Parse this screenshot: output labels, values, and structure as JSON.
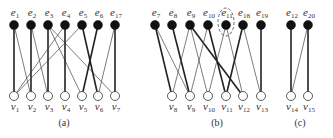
{
  "graphs": [
    {
      "id": "a",
      "caption": "(a)",
      "caption_pos": [
        64,
        126
      ],
      "top_y": 25,
      "bottom_y": 96,
      "top_nodes": [
        {
          "id": "e1",
          "base": "e",
          "sub": "1",
          "x": 14
        },
        {
          "id": "e2",
          "base": "e",
          "sub": "2",
          "x": 31
        },
        {
          "id": "e3",
          "base": "e",
          "sub": "3",
          "x": 48
        },
        {
          "id": "e4",
          "base": "e",
          "sub": "4",
          "x": 65
        },
        {
          "id": "e5",
          "base": "e",
          "sub": "5",
          "x": 82
        },
        {
          "id": "e6",
          "base": "e",
          "sub": "6",
          "x": 98
        },
        {
          "id": "e17",
          "base": "e",
          "sub": "17",
          "x": 115
        }
      ],
      "bottom_nodes": [
        {
          "id": "v1",
          "base": "v",
          "sub": "1",
          "x": 14
        },
        {
          "id": "v2",
          "base": "v",
          "sub": "2",
          "x": 31
        },
        {
          "id": "v3",
          "base": "v",
          "sub": "3",
          "x": 48
        },
        {
          "id": "v4",
          "base": "v",
          "sub": "4",
          "x": 65
        },
        {
          "id": "v5",
          "base": "v",
          "sub": "5",
          "x": 82
        },
        {
          "id": "v6",
          "base": "v",
          "sub": "6",
          "x": 98
        },
        {
          "id": "v7",
          "base": "v",
          "sub": "7",
          "x": 115
        }
      ],
      "edges": [
        {
          "from": "e1",
          "to": "v1",
          "weight": "thick"
        },
        {
          "from": "e1",
          "to": "v2",
          "weight": "thin"
        },
        {
          "from": "e2",
          "to": "v2",
          "weight": "thick"
        },
        {
          "from": "e2",
          "to": "v3",
          "weight": "thin"
        },
        {
          "from": "e3",
          "to": "v3",
          "weight": "thick"
        },
        {
          "from": "e3",
          "to": "v5",
          "weight": "thin"
        },
        {
          "from": "e3",
          "to": "v7",
          "weight": "thin"
        },
        {
          "from": "e4",
          "to": "v4",
          "weight": "thick"
        },
        {
          "from": "e4",
          "to": "v1",
          "weight": "thin"
        },
        {
          "from": "e5",
          "to": "v1",
          "weight": "thin"
        },
        {
          "from": "e5",
          "to": "v6",
          "weight": "thick"
        },
        {
          "from": "e6",
          "to": "v5",
          "weight": "thick"
        },
        {
          "from": "e17",
          "to": "v6",
          "weight": "thin"
        },
        {
          "from": "e17",
          "to": "v7",
          "weight": "thick"
        }
      ]
    },
    {
      "id": "b",
      "caption": "(b)",
      "caption_pos": [
        217,
        126
      ],
      "top_y": 25,
      "bottom_y": 96,
      "top_nodes": [
        {
          "id": "e7",
          "base": "e",
          "sub": "7",
          "x": 155
        },
        {
          "id": "e8",
          "base": "e",
          "sub": "8",
          "x": 172
        },
        {
          "id": "e9",
          "base": "e",
          "sub": "9",
          "x": 190
        },
        {
          "id": "e10",
          "base": "e",
          "sub": "10",
          "x": 208
        },
        {
          "id": "e11",
          "base": "e",
          "sub": "11",
          "x": 226
        },
        {
          "id": "e18",
          "base": "e",
          "sub": "18",
          "x": 243
        },
        {
          "id": "e19",
          "base": "e",
          "sub": "19",
          "x": 261
        }
      ],
      "bottom_nodes": [
        {
          "id": "v8",
          "base": "v",
          "sub": "8",
          "x": 172
        },
        {
          "id": "v9",
          "base": "v",
          "sub": "9",
          "x": 190
        },
        {
          "id": "v10",
          "base": "v",
          "sub": "10",
          "x": 208
        },
        {
          "id": "v11",
          "base": "v",
          "sub": "11",
          "x": 226
        },
        {
          "id": "v12",
          "base": "v",
          "sub": "12",
          "x": 243
        },
        {
          "id": "v13",
          "base": "v",
          "sub": "13",
          "x": 261
        }
      ],
      "edges": [
        {
          "from": "e7",
          "to": "v8",
          "weight": "thick"
        },
        {
          "from": "e7",
          "to": "v9",
          "weight": "thin"
        },
        {
          "from": "e8",
          "to": "v9",
          "weight": "thick"
        },
        {
          "from": "e9",
          "to": "v8",
          "weight": "thin"
        },
        {
          "from": "e9",
          "to": "v10",
          "weight": "thin"
        },
        {
          "from": "e9",
          "to": "v12",
          "weight": "thick"
        },
        {
          "from": "e10",
          "to": "v9",
          "weight": "thin"
        },
        {
          "from": "e10",
          "to": "v11",
          "weight": "thick"
        },
        {
          "from": "e11",
          "to": "v10",
          "weight": "thin"
        },
        {
          "from": "e11",
          "to": "v12",
          "weight": "thin"
        },
        {
          "from": "e18",
          "to": "v11",
          "weight": "thick"
        },
        {
          "from": "e18",
          "to": "v13",
          "weight": "thin"
        },
        {
          "from": "e19",
          "to": "v13",
          "weight": "thick"
        }
      ],
      "highlight": {
        "node": "e11",
        "shape": "dashed-ellipse",
        "cx": 226,
        "cy": 22,
        "rx": 8,
        "ry": 14
      }
    },
    {
      "id": "c",
      "caption": "(c)",
      "caption_pos": [
        300,
        126
      ],
      "top_y": 25,
      "bottom_y": 96,
      "top_nodes": [
        {
          "id": "e12",
          "base": "e",
          "sub": "12",
          "x": 291
        },
        {
          "id": "e20",
          "base": "e",
          "sub": "20",
          "x": 308
        }
      ],
      "bottom_nodes": [
        {
          "id": "v14",
          "base": "v",
          "sub": "14",
          "x": 291
        },
        {
          "id": "v15",
          "base": "v",
          "sub": "15",
          "x": 308
        }
      ],
      "edges": [
        {
          "from": "e12",
          "to": "v14",
          "weight": "thick"
        },
        {
          "from": "e20",
          "to": "v14",
          "weight": "thin"
        },
        {
          "from": "e20",
          "to": "v15",
          "weight": "thick"
        }
      ]
    }
  ]
}
